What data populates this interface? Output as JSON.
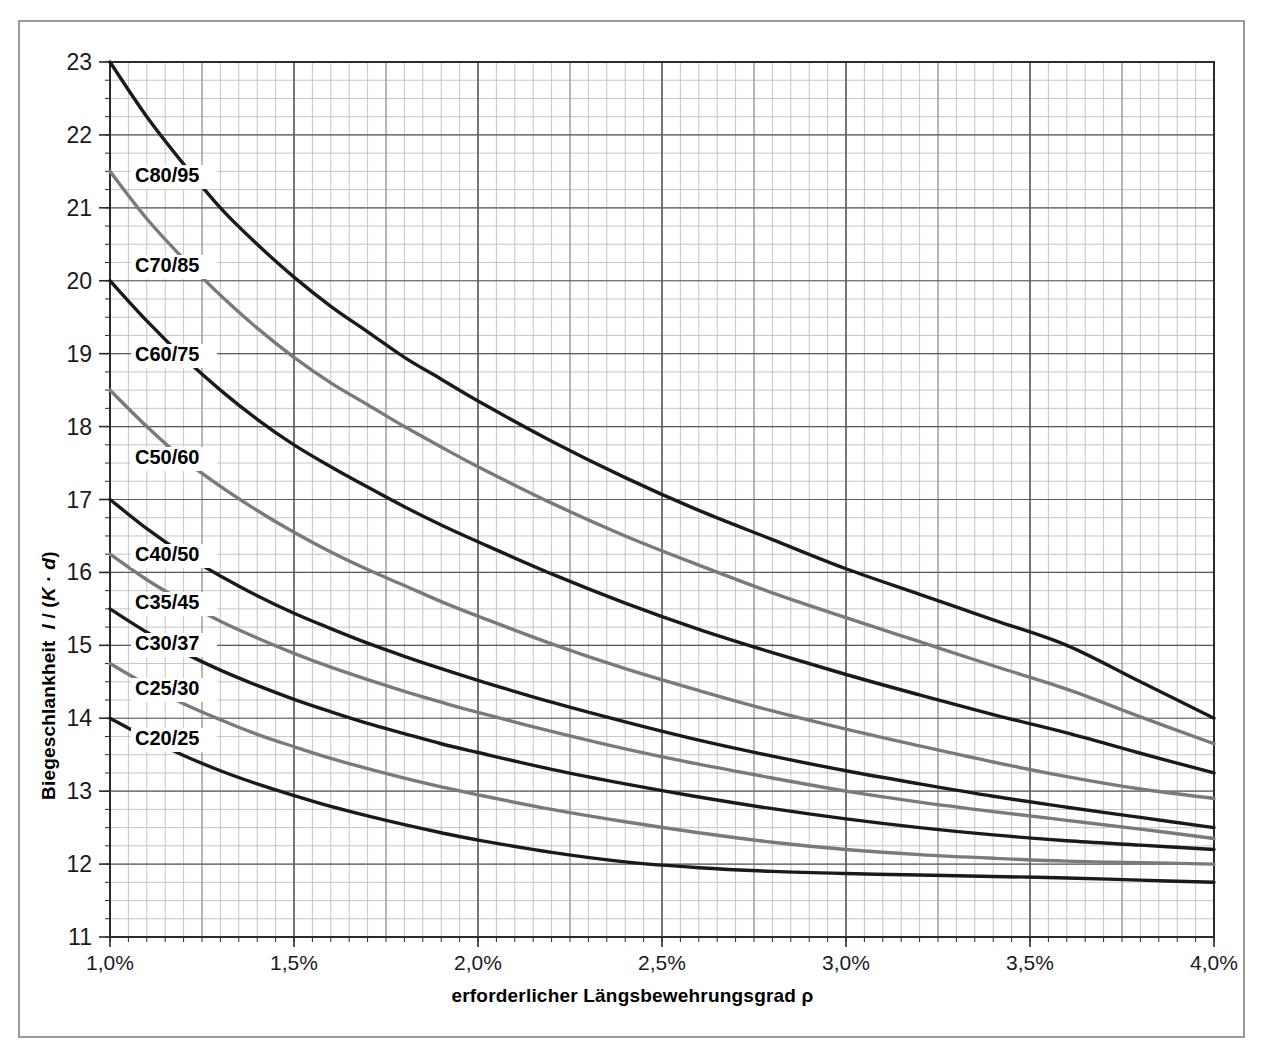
{
  "chart_data": {
    "type": "line",
    "title": "",
    "subtitle": "",
    "xlabel": "erforderlicher Längsbewehrungsgrad ρ",
    "ylabel": "Biegeschlankheit l / (K · d)",
    "ylabel_parts": {
      "main": "Biegeschlankheit",
      "sym_l": "l",
      "sep": " / (",
      "sym_K": "K",
      "dot": " · ",
      "sym_d": "d",
      "close": ")"
    },
    "xlim": [
      1.0,
      4.0
    ],
    "ylim": [
      11,
      23
    ],
    "x_tick_labels": [
      "1,0%",
      "1,5%",
      "2,0%",
      "2,5%",
      "3,0%",
      "3,5%",
      "4,0%"
    ],
    "x_tick_values": [
      1.0,
      1.5,
      2.0,
      2.5,
      3.0,
      3.5,
      4.0
    ],
    "y_tick_labels": [
      "11",
      "12",
      "13",
      "14",
      "15",
      "16",
      "17",
      "18",
      "19",
      "20",
      "21",
      "22",
      "23"
    ],
    "y_tick_values": [
      11,
      12,
      13,
      14,
      15,
      16,
      17,
      18,
      19,
      20,
      21,
      22,
      23
    ],
    "x_minor_step": 0.05,
    "y_minor_step": 0.25,
    "grid": true,
    "grid_color_major": "#5a5a5a",
    "grid_color_minor": "#b8b8b8",
    "legend_position": "inline-labels",
    "colors": {
      "black": "#1a1a1a",
      "gray": "#7a7a7a",
      "frame": "#9a9a9a",
      "axis": "#333333"
    },
    "series": [
      {
        "name": "C80/95",
        "label": "C80/95",
        "color": "#1a1a1a",
        "label_x_px": 135,
        "label_y_px": 182,
        "x": [
          1.0,
          1.1,
          1.2,
          1.3,
          1.4,
          1.5,
          1.6,
          1.7,
          1.8,
          1.9,
          2.0,
          2.2,
          2.4,
          2.6,
          2.8,
          3.0,
          3.2,
          3.4,
          3.6,
          3.8,
          4.0
        ],
        "y": [
          23.0,
          22.25,
          21.6,
          21.0,
          20.5,
          20.05,
          19.65,
          19.3,
          18.95,
          18.65,
          18.35,
          17.8,
          17.3,
          16.85,
          16.45,
          16.05,
          15.7,
          15.35,
          15.0,
          14.5,
          14.0
        ]
      },
      {
        "name": "C70/85",
        "label": "C70/85",
        "color": "#7a7a7a",
        "label_x_px": 135,
        "label_y_px": 272,
        "x": [
          1.0,
          1.1,
          1.2,
          1.3,
          1.4,
          1.5,
          1.6,
          1.7,
          1.8,
          1.9,
          2.0,
          2.2,
          2.4,
          2.6,
          2.8,
          3.0,
          3.2,
          3.4,
          3.6,
          3.8,
          4.0
        ],
        "y": [
          21.5,
          20.85,
          20.3,
          19.8,
          19.35,
          18.95,
          18.6,
          18.3,
          18.0,
          17.72,
          17.45,
          16.95,
          16.5,
          16.1,
          15.72,
          15.38,
          15.05,
          14.72,
          14.4,
          14.02,
          13.65
        ]
      },
      {
        "name": "C60/75",
        "label": "C60/75",
        "color": "#1a1a1a",
        "label_x_px": 135,
        "label_y_px": 361,
        "x": [
          1.0,
          1.1,
          1.2,
          1.3,
          1.4,
          1.5,
          1.6,
          1.7,
          1.8,
          1.9,
          2.0,
          2.2,
          2.4,
          2.6,
          2.8,
          3.0,
          3.2,
          3.4,
          3.6,
          3.8,
          4.0
        ],
        "y": [
          20.0,
          19.45,
          18.95,
          18.5,
          18.1,
          17.75,
          17.45,
          17.17,
          16.9,
          16.65,
          16.42,
          15.98,
          15.58,
          15.22,
          14.9,
          14.6,
          14.32,
          14.05,
          13.8,
          13.52,
          13.25
        ]
      },
      {
        "name": "C50/60",
        "label": "C50/60",
        "color": "#7a7a7a",
        "label_x_px": 135,
        "label_y_px": 464,
        "x": [
          1.0,
          1.1,
          1.2,
          1.3,
          1.4,
          1.5,
          1.6,
          1.7,
          1.8,
          1.9,
          2.0,
          2.2,
          2.4,
          2.6,
          2.8,
          3.0,
          3.2,
          3.4,
          3.6,
          3.8,
          4.0
        ],
        "y": [
          18.5,
          18.0,
          17.55,
          17.18,
          16.85,
          16.55,
          16.28,
          16.04,
          15.82,
          15.6,
          15.4,
          15.02,
          14.68,
          14.38,
          14.1,
          13.85,
          13.62,
          13.4,
          13.2,
          13.03,
          12.9
        ]
      },
      {
        "name": "C40/50",
        "label": "C40/50",
        "color": "#1a1a1a",
        "label_x_px": 135,
        "label_y_px": 561,
        "x": [
          1.0,
          1.1,
          1.2,
          1.3,
          1.4,
          1.5,
          1.6,
          1.7,
          1.8,
          1.9,
          2.0,
          2.2,
          2.4,
          2.6,
          2.8,
          3.0,
          3.2,
          3.4,
          3.6,
          3.8,
          4.0
        ],
        "y": [
          17.0,
          16.6,
          16.25,
          15.95,
          15.68,
          15.44,
          15.23,
          15.03,
          14.85,
          14.68,
          14.52,
          14.22,
          13.95,
          13.7,
          13.48,
          13.28,
          13.1,
          12.93,
          12.78,
          12.64,
          12.5
        ]
      },
      {
        "name": "C35/45",
        "label": "C35/45",
        "color": "#7a7a7a",
        "label_x_px": 135,
        "label_y_px": 609,
        "x": [
          1.0,
          1.1,
          1.2,
          1.3,
          1.4,
          1.5,
          1.6,
          1.7,
          1.8,
          1.9,
          2.0,
          2.2,
          2.4,
          2.6,
          2.8,
          3.0,
          3.2,
          3.4,
          3.6,
          3.8,
          4.0
        ],
        "y": [
          16.25,
          15.9,
          15.6,
          15.33,
          15.1,
          14.89,
          14.7,
          14.53,
          14.37,
          14.22,
          14.08,
          13.82,
          13.58,
          13.37,
          13.18,
          13.0,
          12.85,
          12.72,
          12.6,
          12.48,
          12.35
        ]
      },
      {
        "name": "C30/37",
        "label": "C30/37",
        "color": "#1a1a1a",
        "label_x_px": 135,
        "label_y_px": 650,
        "x": [
          1.0,
          1.1,
          1.2,
          1.3,
          1.4,
          1.5,
          1.6,
          1.7,
          1.8,
          1.9,
          2.0,
          2.2,
          2.4,
          2.6,
          2.8,
          3.0,
          3.2,
          3.4,
          3.6,
          3.8,
          4.0
        ],
        "y": [
          15.5,
          15.18,
          14.9,
          14.66,
          14.45,
          14.26,
          14.09,
          13.93,
          13.79,
          13.65,
          13.53,
          13.3,
          13.1,
          12.92,
          12.76,
          12.62,
          12.5,
          12.4,
          12.32,
          12.26,
          12.2
        ]
      },
      {
        "name": "C25/30",
        "label": "C25/30",
        "color": "#7a7a7a",
        "label_x_px": 135,
        "label_y_px": 695,
        "x": [
          1.0,
          1.1,
          1.2,
          1.3,
          1.4,
          1.5,
          1.6,
          1.7,
          1.8,
          1.9,
          2.0,
          2.2,
          2.4,
          2.6,
          2.8,
          3.0,
          3.2,
          3.4,
          3.6,
          3.8,
          4.0
        ],
        "y": [
          14.75,
          14.46,
          14.2,
          13.98,
          13.78,
          13.61,
          13.45,
          13.31,
          13.18,
          13.06,
          12.95,
          12.75,
          12.58,
          12.43,
          12.3,
          12.2,
          12.13,
          12.08,
          12.04,
          12.02,
          12.0
        ]
      },
      {
        "name": "C20/25",
        "label": "C20/25",
        "color": "#1a1a1a",
        "label_x_px": 135,
        "label_y_px": 745,
        "x": [
          1.0,
          1.1,
          1.2,
          1.3,
          1.4,
          1.5,
          1.6,
          1.7,
          1.8,
          1.9,
          2.0,
          2.2,
          2.4,
          2.6,
          2.8,
          3.0,
          3.2,
          3.4,
          3.6,
          3.8,
          4.0
        ],
        "y": [
          14.0,
          13.73,
          13.49,
          13.28,
          13.1,
          12.94,
          12.79,
          12.66,
          12.54,
          12.43,
          12.33,
          12.16,
          12.03,
          11.95,
          11.9,
          11.87,
          11.85,
          11.83,
          11.81,
          11.78,
          11.75
        ]
      }
    ]
  },
  "plot_geometry": {
    "left_px": 110,
    "top_px": 62,
    "right_px": 1214,
    "bottom_px": 937
  }
}
